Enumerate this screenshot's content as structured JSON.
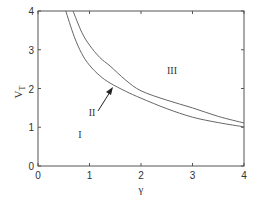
{
  "chart_data": {
    "type": "line",
    "title": "",
    "xlabel": "γ",
    "ylabel": "V_T",
    "xlim": [
      0,
      4
    ],
    "ylim": [
      0,
      4
    ],
    "x_ticks": [
      "0",
      "1",
      "2",
      "3",
      "4"
    ],
    "y_ticks": [
      "0",
      "1",
      "2",
      "3",
      "4"
    ],
    "grid": false,
    "legend": null,
    "series": [
      {
        "name": "boundary I-II (lower)",
        "x": [
          0.54,
          0.7,
          0.85,
          1.0,
          1.2,
          1.4,
          1.7,
          2.0,
          2.5,
          3.0,
          3.5,
          4.0
        ],
        "y": [
          4.0,
          3.35,
          2.9,
          2.6,
          2.33,
          2.14,
          1.93,
          1.75,
          1.48,
          1.26,
          1.12,
          1.01
        ]
      },
      {
        "name": "boundary II-III (upper)",
        "x": [
          0.68,
          0.85,
          1.0,
          1.2,
          1.4,
          1.7,
          2.0,
          2.5,
          3.0,
          3.5,
          4.0
        ],
        "y": [
          4.0,
          3.45,
          3.12,
          2.8,
          2.58,
          2.22,
          1.94,
          1.7,
          1.5,
          1.28,
          1.11
        ]
      }
    ],
    "annotations": [
      {
        "text": "I",
        "x": 0.82,
        "y": 0.8
      },
      {
        "text": "II",
        "x": 1.05,
        "y": 1.4
      },
      {
        "text": "III",
        "x": 2.6,
        "y": 2.5
      },
      {
        "text": "arrow",
        "from": [
          1.15,
          1.4
        ],
        "to": [
          1.45,
          2.05
        ]
      }
    ]
  },
  "labels": {
    "x_axis": "γ",
    "y_axis_main": "V",
    "y_axis_sub": "T",
    "region_1": "I",
    "region_2": "II",
    "region_3": "III",
    "xticks": [
      "0",
      "1",
      "2",
      "3",
      "4"
    ],
    "yticks": [
      "0",
      "1",
      "2",
      "3",
      "4"
    ]
  },
  "colors": {
    "axis": "#555555",
    "curve": "#666666",
    "text": "#333333"
  }
}
